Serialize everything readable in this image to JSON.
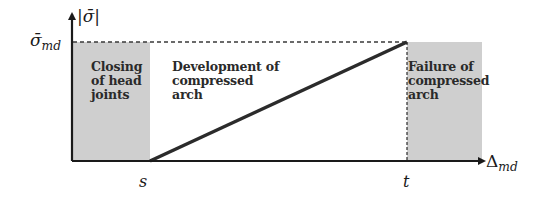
{
  "diagram": {
    "type": "stress-displacement-phases",
    "y_axis": {
      "label_symbol": "σ",
      "label_text": "|σ̄|",
      "max_label_base": "σ̄",
      "max_label_sub": "md"
    },
    "x_axis": {
      "label_base": "Δ",
      "label_sub": "md",
      "ticks": [
        {
          "label": "s"
        },
        {
          "label": "t"
        }
      ]
    },
    "regions": [
      {
        "id": "closing",
        "label": "Closing\nof head\njoints",
        "shaded": true
      },
      {
        "id": "development",
        "label": "Development of\ncompressed\narch",
        "shaded": false
      },
      {
        "id": "failure",
        "label": "Failure of\ncompressed\narch",
        "shaded": true
      }
    ],
    "curve": {
      "description": "linear rise from s to t reaching σ̄_md",
      "points": [
        [
          "s",
          0
        ],
        [
          "t",
          "σ̄_md"
        ]
      ]
    },
    "colors": {
      "shade": "#cfcfcf",
      "line": "#2b2b2b",
      "axis": "#1a1a1a",
      "dash": "#3a3a3a"
    }
  }
}
